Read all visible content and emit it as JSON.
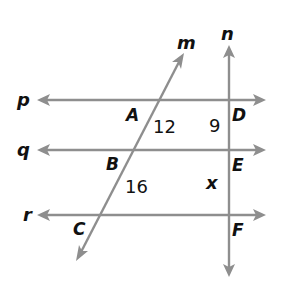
{
  "diagram": {
    "line_color": "#8e8e8e",
    "text_color": "#111111",
    "lines": {
      "p": {
        "label": "p"
      },
      "q": {
        "label": "q"
      },
      "r": {
        "label": "r"
      },
      "m": {
        "label": "m"
      },
      "n": {
        "label": "n"
      }
    },
    "points": {
      "A": "A",
      "B": "B",
      "C": "C",
      "D": "D",
      "E": "E",
      "F": "F"
    },
    "segment_values": {
      "AB": "12",
      "BC": "16",
      "DE": "9",
      "EF": "x"
    }
  }
}
